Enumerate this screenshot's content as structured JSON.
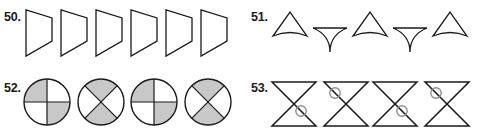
{
  "page": {
    "background_color": "#ffffff",
    "ink_color": "#1a1a1a",
    "shade_color": "#c8c8c8"
  },
  "problems": [
    {
      "number": "50.",
      "name": "problem-50",
      "description": "Six identical right-pointing quadrilateral arrow shapes in a row",
      "figure_count": 6,
      "figure_type": "quadrilateral-arrow",
      "figures": [
        {
          "label": "shape-1",
          "orientation": "right"
        },
        {
          "label": "shape-2",
          "orientation": "right"
        },
        {
          "label": "shape-3",
          "orientation": "right"
        },
        {
          "label": "shape-4",
          "orientation": "right"
        },
        {
          "label": "shape-5",
          "orientation": "right"
        },
        {
          "label": "shape-6",
          "orientation": "right"
        }
      ]
    },
    {
      "number": "51.",
      "name": "problem-51",
      "description": "Five curved-base triangles alternating pointing up and pointing down",
      "figure_count": 5,
      "figure_type": "curved-base-triangle",
      "figures": [
        {
          "label": "shape-1",
          "orientation": "up"
        },
        {
          "label": "shape-2",
          "orientation": "down"
        },
        {
          "label": "shape-3",
          "orientation": "up"
        },
        {
          "label": "shape-4",
          "orientation": "down"
        },
        {
          "label": "shape-5",
          "orientation": "up"
        }
      ]
    },
    {
      "number": "52.",
      "name": "problem-52",
      "description": "Four circles divided into four parts, alternating plus-split and X-split, with two opposite sectors shaded gray",
      "figure_count": 4,
      "figure_type": "quartered-circle",
      "figures": [
        {
          "label": "shape-1",
          "split": "plus",
          "shaded_sectors": "top-left and bottom-right"
        },
        {
          "label": "shape-2",
          "split": "x",
          "shaded_sectors": "top and bottom"
        },
        {
          "label": "shape-3",
          "split": "plus",
          "shaded_sectors": "top-left and bottom-right"
        },
        {
          "label": "shape-4",
          "split": "x",
          "shaded_sectors": "top and bottom"
        }
      ]
    },
    {
      "number": "53.",
      "name": "problem-53",
      "description": "Four hourglass bowtie shapes with a small circle alternating between lower-right and upper-left of the crossing point",
      "figure_count": 4,
      "figure_type": "hourglass-with-circle",
      "figures": [
        {
          "label": "shape-1",
          "circle_position": "lower-right"
        },
        {
          "label": "shape-2",
          "circle_position": "upper-left"
        },
        {
          "label": "shape-3",
          "circle_position": "lower-right"
        },
        {
          "label": "shape-4",
          "circle_position": "upper-left"
        }
      ]
    }
  ]
}
